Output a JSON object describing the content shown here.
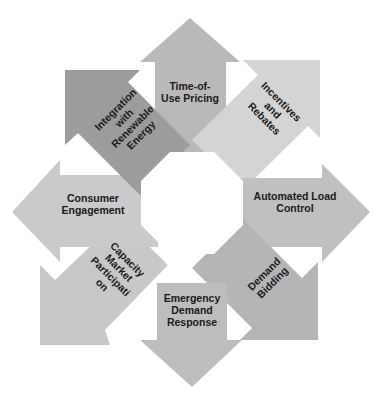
{
  "diagram": {
    "type": "octagonal-cycle",
    "segments": [
      {
        "label": "Time-of-\nUse Pricing",
        "line1": "Time-of-",
        "line2": "Use Pricing",
        "color": "#b9b9b9"
      },
      {
        "label": "Incentives and Rebates",
        "line1": "Incentives",
        "line2": "and",
        "line3": "Rebates",
        "color": "#d2d2d2"
      },
      {
        "label": "Automated Load Control",
        "line1": "Automated Load",
        "line2": "Control",
        "color": "#bfbfbf"
      },
      {
        "label": "Demand Bidding",
        "line1": "Demand",
        "line2": "Bidding",
        "color": "#b3b3b3"
      },
      {
        "label": "Emergency Demand Response",
        "line1": "Emergency",
        "line2": "Demand",
        "line3": "Response",
        "color": "#bdbdbd"
      },
      {
        "label": "Capacity Market Participation",
        "line1": "Capacity",
        "line2": "Market",
        "line3": "Participati",
        "line4": "on",
        "color": "#c6c6c6"
      },
      {
        "label": "Consumer Engagement",
        "line1": "Consumer",
        "line2": "Engagement",
        "color": "#c9c9c9"
      },
      {
        "label": "Integration with Renewable Energy",
        "line1": "Integration",
        "line2": "with",
        "line3": "Renewable",
        "line4": "Energy",
        "color": "#9a9a9a"
      }
    ]
  }
}
